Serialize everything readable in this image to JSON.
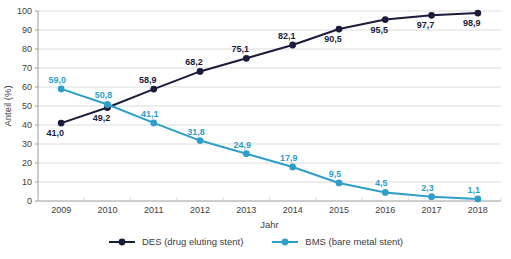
{
  "chart_data": {
    "type": "line",
    "title": "",
    "xlabel": "Jahr",
    "ylabel": "Anteil (%)",
    "ylim": [
      0,
      100
    ],
    "ytick_step": 10,
    "ytick_labels": [
      "0",
      "10",
      "20",
      "30",
      "40",
      "50",
      "60",
      "70",
      "80",
      "90",
      "100"
    ],
    "grid": "horizontal",
    "legend_position": "bottom",
    "categories": [
      "2009",
      "2010",
      "2011",
      "2012",
      "2013",
      "2014",
      "2015",
      "2016",
      "2017",
      "2018"
    ],
    "series": [
      {
        "name": "DES (drug eluting stent)",
        "color": "#1b1b3a",
        "values": [
          41.0,
          49.2,
          58.9,
          68.2,
          75.1,
          82.1,
          90.5,
          95.5,
          97.7,
          98.9
        ],
        "labels": [
          "41,0",
          "49,2",
          "58,9",
          "68,2",
          "75,1",
          "82,1",
          "90,5",
          "95,5",
          "97,7",
          "98,9"
        ],
        "label_side": [
          "below",
          "below",
          "above",
          "above",
          "above",
          "above",
          "below",
          "below",
          "below",
          "below"
        ]
      },
      {
        "name": "BMS (bare metal stent)",
        "color": "#2e9fc8",
        "values": [
          59.0,
          50.8,
          41.1,
          31.8,
          24.9,
          17.9,
          9.5,
          4.5,
          2.3,
          1.1
        ],
        "labels": [
          "59,0",
          "50,8",
          "41,1",
          "31,8",
          "24,9",
          "17,9",
          "9,5",
          "4,5",
          "2,3",
          "1,1"
        ],
        "label_side": [
          "above",
          "above",
          "above",
          "above",
          "above",
          "above",
          "above",
          "above",
          "above",
          "above"
        ]
      }
    ],
    "colors": {
      "grid": "#dcdcdc",
      "axis": "#9c9c9c",
      "text": "#3d3d3d"
    }
  }
}
